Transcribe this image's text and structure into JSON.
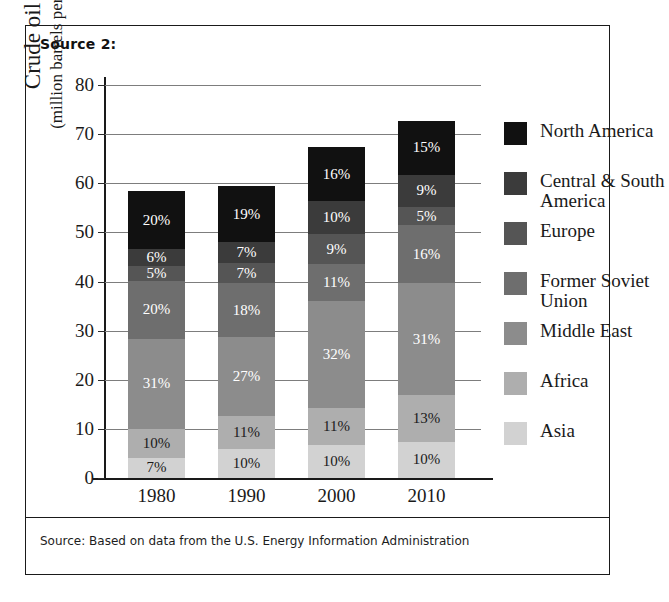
{
  "figure": {
    "source_header": "Source 2:",
    "footnote": "Source: Based on data from the U.S. Energy Information Administration"
  },
  "chart_data": {
    "type": "bar",
    "stacked": true,
    "title": "",
    "xlabel": "",
    "ylabel": "Crude oil (million barrels per day)",
    "ylabel_line1": "Crude oil",
    "ylabel_line2": "(million barrels per day)",
    "ylim": [
      0,
      80
    ],
    "yticks": [
      0,
      10,
      20,
      30,
      40,
      50,
      60,
      70,
      80
    ],
    "ytick_labels": [
      "0",
      "10",
      "20",
      "30",
      "40",
      "50",
      "60",
      "70",
      "80"
    ],
    "grid": true,
    "legend_position": "right",
    "categories": [
      "1980",
      "1990",
      "2000",
      "2010"
    ],
    "totals": [
      59,
      60,
      68,
      73.5
    ],
    "value_unit": "percent",
    "series": [
      {
        "name": "North America",
        "color": "#111111",
        "label_color": "#ffffff",
        "values": [
          20,
          19,
          16,
          15
        ],
        "labels": [
          "20%",
          "19%",
          "16%",
          "15%"
        ]
      },
      {
        "name": "Central & South America",
        "color": "#3b3b3b",
        "label_color": "#ffffff",
        "values": [
          6,
          7,
          10,
          9
        ],
        "labels": [
          "6%",
          "7%",
          "10%",
          "9%"
        ]
      },
      {
        "name": "Europe",
        "color": "#555555",
        "label_color": "#ffffff",
        "values": [
          5,
          7,
          9,
          5
        ],
        "labels": [
          "5%",
          "7%",
          "9%",
          "5%"
        ]
      },
      {
        "name": "Former Soviet Union",
        "color": "#6e6e6e",
        "label_color": "#ffffff",
        "values": [
          20,
          18,
          11,
          16
        ],
        "labels": [
          "20%",
          "18%",
          "11%",
          "16%"
        ]
      },
      {
        "name": "Middle East",
        "color": "#8c8c8c",
        "label_color": "#ffffff",
        "values": [
          31,
          27,
          32,
          31
        ],
        "labels": [
          "31%",
          "27%",
          "32%",
          "31%"
        ]
      },
      {
        "name": "Africa",
        "color": "#aeaeae",
        "label_color": "#1a1a1a",
        "values": [
          10,
          11,
          11,
          13
        ],
        "labels": [
          "10%",
          "11%",
          "11%",
          "13%"
        ]
      },
      {
        "name": "Asia",
        "color": "#d2d2d2",
        "label_color": "#1a1a1a",
        "values": [
          7,
          10,
          10,
          10
        ],
        "labels": [
          "7%",
          "10%",
          "10%",
          "10%"
        ]
      }
    ]
  }
}
